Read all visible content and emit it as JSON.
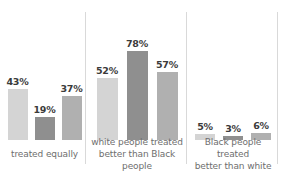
{
  "chart_data": {
    "type": "bar",
    "title": "",
    "subtitle": "",
    "xlabel": "",
    "ylabel": "",
    "ylim": [
      0,
      100
    ],
    "grid": false,
    "legend": "none",
    "value_suffix": "%",
    "categories": [
      "treated equally",
      "white people treated better than Black people",
      "Black people treated better than white"
    ],
    "series": [
      {
        "name": "series-1",
        "shade": "light",
        "color": "#d4d4d4",
        "values": [
          43,
          52,
          5
        ]
      },
      {
        "name": "series-2",
        "shade": "dark",
        "color": "#8f8f8f",
        "values": [
          19,
          78,
          3
        ]
      },
      {
        "name": "series-3",
        "shade": "mid",
        "color": "#b0b0b0",
        "values": [
          37,
          57,
          6
        ]
      }
    ],
    "groups": [
      {
        "label": "treated equally",
        "label_lines": [
          "treated equally"
        ],
        "bars": [
          {
            "value": 43,
            "label": "43%",
            "shade": "light"
          },
          {
            "value": 19,
            "label": "19%",
            "shade": "dark"
          },
          {
            "value": 37,
            "label": "37%",
            "shade": "mid"
          }
        ]
      },
      {
        "label": "white people treated better than Black people",
        "label_lines": [
          "white people treated",
          "better than Black people"
        ],
        "bars": [
          {
            "value": 52,
            "label": "52%",
            "shade": "light"
          },
          {
            "value": 78,
            "label": "78%",
            "shade": "dark"
          },
          {
            "value": 57,
            "label": "57%",
            "shade": "mid"
          }
        ]
      },
      {
        "label": "Black people treated better than white",
        "label_lines": [
          "Black people treated",
          "better than white"
        ],
        "bars": [
          {
            "value": 5,
            "label": "5%",
            "shade": "light"
          },
          {
            "value": 3,
            "label": "3%",
            "shade": "dark"
          },
          {
            "value": 6,
            "label": "6%",
            "shade": "mid"
          }
        ]
      }
    ]
  },
  "colors": {
    "background": "#ffffff",
    "bar_light": "#d4d4d4",
    "bar_dark": "#8f8f8f",
    "bar_mid": "#b0b0b0",
    "value_text": "#3b3b3b",
    "label_text": "#6e6e6e",
    "separator": "#d9d9d9"
  }
}
